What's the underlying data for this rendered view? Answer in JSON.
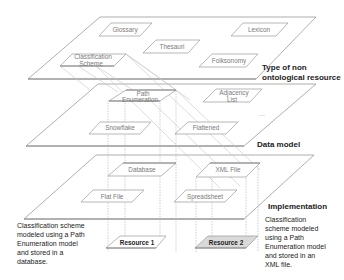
{
  "layers": {
    "top": "Type of non ontological resource",
    "top_line1": "Type of non",
    "top_line2": "ontological resource",
    "middle": "Data model",
    "bottom": "Implementation"
  },
  "resource_types": {
    "glossary": "Glossary",
    "lexicon": "Lexicon",
    "thesauri": "Thesauri",
    "classification_line1": "Classification",
    "classification_line2": "Scheme",
    "folksonomy": "Folksonomy"
  },
  "data_models": {
    "path_line1": "Path",
    "path_line2": "Enumeration",
    "adjacency_line1": "Adjacency",
    "adjacency_line2": "List",
    "snowflake": "Snowflake",
    "flattened": "Flattened",
    "ellipsis": "..."
  },
  "implementations": {
    "database": "Database",
    "xml_file": "XML File",
    "flat_file": "Flat File",
    "spreadsheet": "Spreadsheet"
  },
  "resources": {
    "resource1": "Resource 1",
    "resource2": "Resource 2"
  },
  "notes": {
    "left": [
      "Classification scheme",
      "modeled using a Path",
      "Enumeration model",
      "and stored in a",
      "database."
    ],
    "right": [
      "Classification",
      "scheme modeled",
      "using a Path",
      "Enumeration model",
      "and stored in an",
      "XML file."
    ]
  }
}
